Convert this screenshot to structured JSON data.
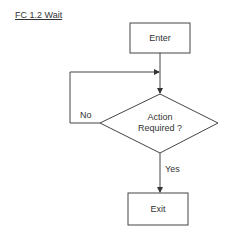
{
  "title": "FC 1.2 Wait",
  "nodes": {
    "start": {
      "label": "Enter",
      "shape": "rectangle"
    },
    "decision": {
      "line1": "Action",
      "line2": "Required ?",
      "shape": "diamond"
    },
    "end": {
      "label": "Exit",
      "shape": "rectangle"
    }
  },
  "edges": {
    "no": {
      "label": "No",
      "from": "decision",
      "to": "decision-input"
    },
    "yes": {
      "label": "Yes",
      "from": "decision",
      "to": "end"
    }
  }
}
